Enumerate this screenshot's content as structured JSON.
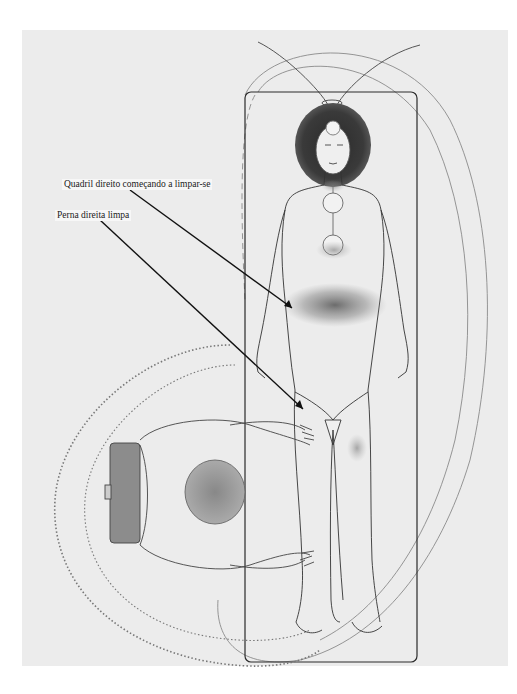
{
  "figure": {
    "background_color": "#ececec",
    "line_color": "#222222",
    "annotations": [
      {
        "id": "hip",
        "text": "Quadril direito começando a limpar-se",
        "points_to": "right hip region"
      },
      {
        "id": "leg",
        "text": "Perna direita limpa",
        "points_to": "right leg"
      }
    ]
  }
}
